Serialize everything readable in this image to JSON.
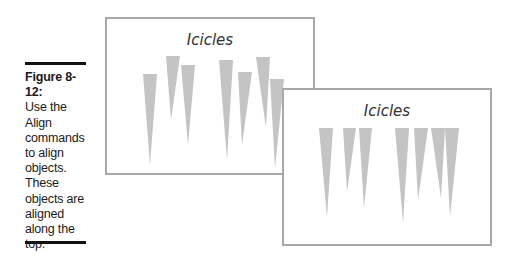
{
  "caption": {
    "label": "Figure 8-12:",
    "lines": [
      "Use the",
      "Align",
      "commands",
      "to align",
      "objects.",
      "These",
      "objects are",
      "aligned",
      "along the",
      "top."
    ]
  },
  "slides": [
    {
      "name": "before-alignment",
      "title": "Icicles",
      "icicle_color": "#c4c4c4",
      "icicles": [
        {
          "left": 38,
          "right": 52,
          "top": 57,
          "tip_x": 45,
          "tip_y": 148
        },
        {
          "left": 61,
          "right": 75,
          "top": 39,
          "tip_x": 66,
          "tip_y": 103
        },
        {
          "left": 76,
          "right": 90,
          "top": 48,
          "tip_x": 83,
          "tip_y": 128
        },
        {
          "left": 114,
          "right": 128,
          "top": 43,
          "tip_x": 122,
          "tip_y": 143
        },
        {
          "left": 133,
          "right": 147,
          "top": 55,
          "tip_x": 137,
          "tip_y": 128
        },
        {
          "left": 151,
          "right": 165,
          "top": 40,
          "tip_x": 161,
          "tip_y": 111
        },
        {
          "left": 165,
          "right": 179,
          "top": 62,
          "tip_x": 170,
          "tip_y": 151
        }
      ]
    },
    {
      "name": "after-align-top",
      "title": "Icicles",
      "icicle_color": "#c4c4c4",
      "icicles": [
        {
          "left": 37,
          "right": 51,
          "top": 40,
          "tip_x": 45,
          "tip_y": 129
        },
        {
          "left": 61,
          "right": 74,
          "top": 40,
          "tip_x": 65,
          "tip_y": 104
        },
        {
          "left": 77,
          "right": 90,
          "top": 40,
          "tip_x": 82,
          "tip_y": 120
        },
        {
          "left": 113,
          "right": 127,
          "top": 40,
          "tip_x": 121,
          "tip_y": 135
        },
        {
          "left": 132,
          "right": 146,
          "top": 40,
          "tip_x": 136,
          "tip_y": 112
        },
        {
          "left": 149,
          "right": 163,
          "top": 40,
          "tip_x": 159,
          "tip_y": 110
        },
        {
          "left": 163,
          "right": 177,
          "top": 40,
          "tip_x": 168,
          "tip_y": 129
        }
      ]
    }
  ]
}
